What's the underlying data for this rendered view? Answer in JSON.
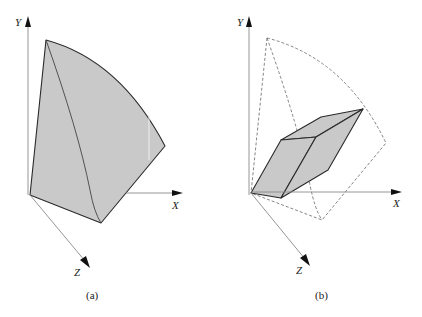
{
  "figures": [
    {
      "id": "a",
      "caption": "(a)",
      "axes": {
        "x": "X",
        "y": "Y",
        "z": "Z"
      },
      "description": "Filled spherical wedge sector bounded by the axes"
    },
    {
      "id": "b",
      "caption": "(b)",
      "axes": {
        "x": "X",
        "y": "Y",
        "z": "Z"
      },
      "description": "Dashed outline of the sector with inscribed filled parallelepiped"
    }
  ],
  "colors": {
    "fill": "#c9c9c9",
    "stroke": "#2a2a2a",
    "axis": "#8a8a8a"
  }
}
